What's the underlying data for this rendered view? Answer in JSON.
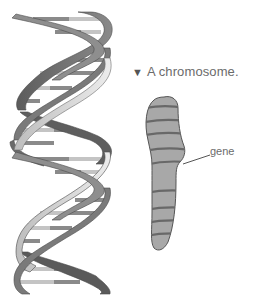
{
  "figure": {
    "caption": {
      "marker": "▼",
      "text": "A chromosome."
    },
    "labels": {
      "gene": "gene"
    },
    "dna_helix": {
      "description": "DNA double helix",
      "strand_dark": "#6e6e6e",
      "strand_light": "#d8d8d8",
      "strand_mid": "#9a9a9a",
      "base_pair_colors": [
        "#8a8a8a",
        "#bdbdbd"
      ]
    },
    "chromosome": {
      "fill": "#a6a6a6",
      "outline": "#5a5a5a",
      "band_color": "#6a6a6a",
      "band_count": 9
    }
  }
}
